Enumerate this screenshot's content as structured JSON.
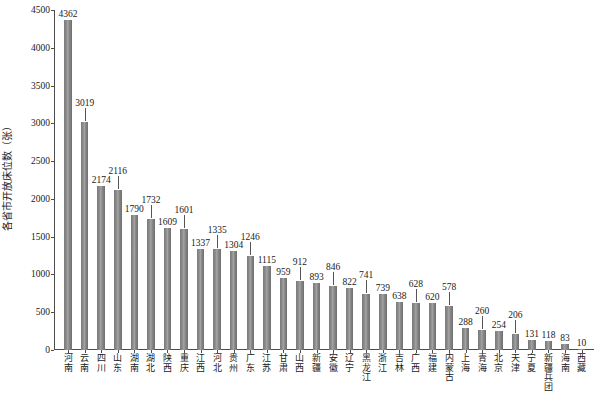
{
  "chart_data": {
    "type": "bar",
    "title": "",
    "subtitle": "",
    "xlabel": "",
    "ylabel": "各省市开放床位数（张）",
    "ylim": [
      0,
      4500
    ],
    "grid": false,
    "legend": null,
    "legend_position": "none",
    "bar_color": "#808080",
    "axis_color": "#4d4d4d",
    "text_color": "#1a1a1a",
    "ytick_labels": [
      "0",
      "500",
      "1000",
      "1500",
      "2000",
      "2500",
      "3000",
      "3500",
      "4000",
      "4500"
    ],
    "ytick_values": [
      0,
      500,
      1000,
      1500,
      2000,
      2500,
      3000,
      3500,
      4000,
      4500
    ],
    "categories": [
      "河南",
      "云南",
      "四川",
      "山东",
      "湖南",
      "湖北",
      "陕西",
      "重庆",
      "江西",
      "河北",
      "贵州",
      "广东",
      "江苏",
      "甘肃",
      "山西",
      "新疆",
      "安徽",
      "辽宁",
      "黑龙江",
      "浙江",
      "吉林",
      "广西",
      "福建",
      "内蒙古",
      "上海",
      "青海",
      "北京",
      "天津",
      "宁夏",
      "新疆兵团",
      "海南",
      "西藏"
    ],
    "values": [
      4362,
      3019,
      2174,
      2116,
      1790,
      1732,
      1609,
      1601,
      1337,
      1335,
      1304,
      1246,
      1115,
      959,
      912,
      893,
      846,
      822,
      741,
      739,
      638,
      628,
      620,
      578,
      288,
      260,
      254,
      206,
      131,
      118,
      83,
      10
    ],
    "data_labels": [
      "4362",
      "3019",
      "2174",
      "2116",
      "1790",
      "1732",
      "1609",
      "1601",
      "1337",
      "1335",
      "1304",
      "1246",
      "1115",
      "959",
      "912",
      "893",
      "846",
      "822",
      "741",
      "739",
      "638",
      "628",
      "620",
      "578",
      "288",
      "260",
      "254",
      "206",
      "131",
      "118",
      "83",
      "10"
    ]
  }
}
